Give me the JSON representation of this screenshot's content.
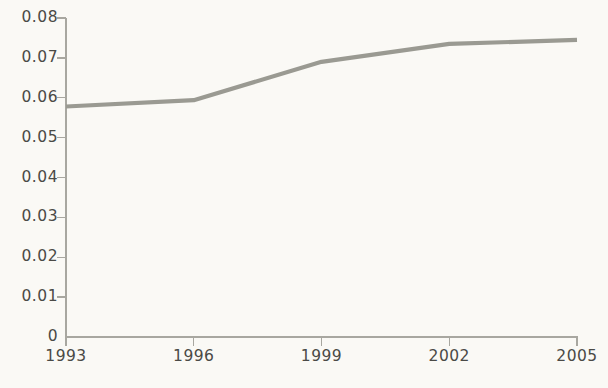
{
  "chart_data": {
    "type": "line",
    "title": "",
    "subtitle": "",
    "xlabel": "",
    "ylabel": "",
    "x": [
      1993,
      1996,
      1999,
      2002,
      2005
    ],
    "categories": [
      "1993",
      "1996",
      "1999",
      "2002",
      "2005"
    ],
    "values": [
      0.0578,
      0.0594,
      0.069,
      0.0735,
      0.0745
    ],
    "series": [
      {
        "name": "",
        "values": [
          0.0578,
          0.0594,
          0.069,
          0.0735,
          0.0745
        ]
      }
    ],
    "xlim": [
      1993,
      2005
    ],
    "ylim": [
      0,
      0.08
    ],
    "ytick_labels": [
      "0.08",
      "0.07",
      "0.06",
      "0.05",
      "0.04",
      "0.03",
      "0.02",
      "0.01",
      "0"
    ],
    "ytick_values": [
      0.08,
      0.07,
      0.06,
      0.05,
      0.04,
      0.03,
      0.02,
      0.01,
      0
    ],
    "xtick_labels": [
      "1993",
      "1996",
      "1999",
      "2002",
      "2005"
    ],
    "grid": false,
    "legend": false,
    "legend_position": "none",
    "annotations": [],
    "line_color": "#9a9a92",
    "axis_color": "#a8a7a0",
    "text_color": "#4a4a46",
    "background_color": "#faf9f5"
  },
  "caption": {
    "text": ""
  }
}
